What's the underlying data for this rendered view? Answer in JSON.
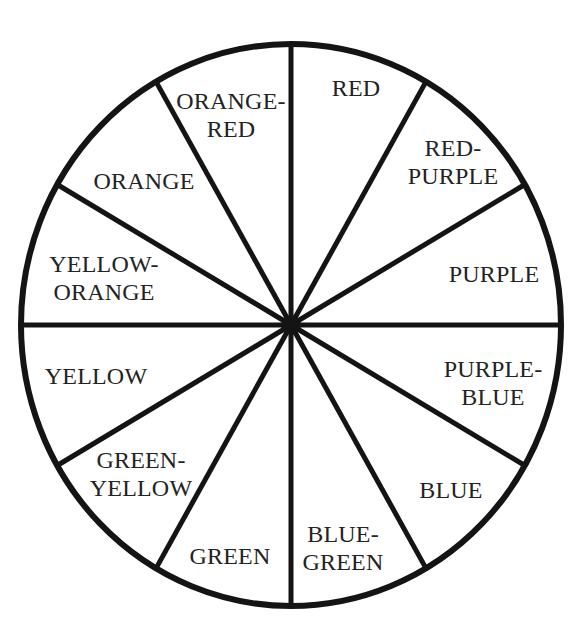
{
  "title": "COLOR WHEEL",
  "wheel": {
    "center": [
      291,
      325
    ],
    "rx": 270,
    "ry": 281,
    "stroke_color": "#141414",
    "stroke_width": 6,
    "hub_radius": 10,
    "spoke_angles_deg": [
      0,
      30,
      60,
      90,
      120,
      150,
      180,
      210,
      240,
      270,
      300,
      330
    ]
  },
  "segments": [
    {
      "id": "red",
      "lines": [
        "RED"
      ],
      "pos": [
        356,
        88
      ]
    },
    {
      "id": "red-purple",
      "lines": [
        "RED-",
        "PURPLE"
      ],
      "pos": [
        453,
        162
      ]
    },
    {
      "id": "purple",
      "lines": [
        "PURPLE"
      ],
      "pos": [
        494,
        274
      ]
    },
    {
      "id": "purple-blue",
      "lines": [
        "PURPLE-",
        "BLUE"
      ],
      "pos": [
        493,
        383
      ]
    },
    {
      "id": "blue",
      "lines": [
        "BLUE"
      ],
      "pos": [
        451,
        490
      ]
    },
    {
      "id": "blue-green",
      "lines": [
        "BLUE-",
        "GREEN"
      ],
      "pos": [
        343,
        548
      ]
    },
    {
      "id": "green",
      "lines": [
        "GREEN"
      ],
      "pos": [
        230,
        556
      ]
    },
    {
      "id": "green-yellow",
      "lines": [
        "GREEN-",
        "YELLOW"
      ],
      "pos": [
        141,
        474
      ]
    },
    {
      "id": "yellow",
      "lines": [
        "YELLOW"
      ],
      "pos": [
        96,
        376
      ]
    },
    {
      "id": "yellow-orange",
      "lines": [
        "YELLOW-",
        "ORANGE"
      ],
      "pos": [
        104,
        278
      ]
    },
    {
      "id": "orange",
      "lines": [
        "ORANGE"
      ],
      "pos": [
        144,
        181
      ]
    },
    {
      "id": "orange-red",
      "lines": [
        "ORANGE-",
        "RED"
      ],
      "pos": [
        231,
        115
      ]
    }
  ]
}
